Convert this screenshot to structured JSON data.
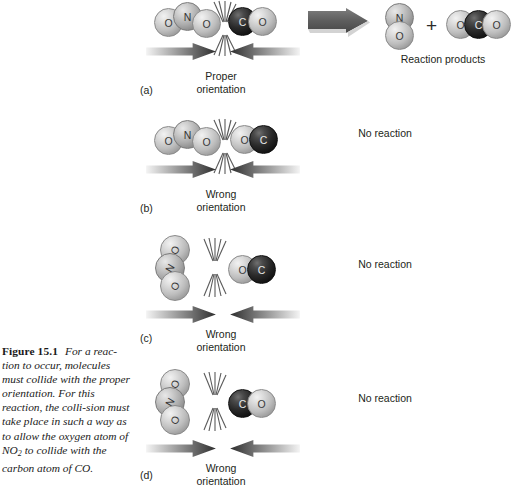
{
  "figure": {
    "number": "Figure 15.1",
    "caption_part1": "For a reac-",
    "caption_rest_a": "tion to occur, molecules must collide with the proper orientation. For this reaction, the colli-sion must take place in such a way as to allow the ",
    "caption_oxygen": "oxygen atom of NO",
    "caption_sub": "2",
    "caption_tail": " to collide with the carbon atom of CO."
  },
  "panels": [
    {
      "id": "a",
      "letter": "(a)",
      "orientation_line1": "Proper",
      "orientation_line2": "orientation",
      "reactant_left": {
        "name": "nitrogen-dioxide",
        "atoms": [
          "O",
          "N",
          "O"
        ],
        "layout": "horizontal"
      },
      "reactant_right": {
        "name": "carbon-monoxide",
        "atoms": [
          "C",
          "O"
        ],
        "layout": "horizontal"
      },
      "outcome": "reaction",
      "products_label": "Reaction products",
      "product_1": {
        "name": "nitric-oxide",
        "atoms": [
          "N",
          "O"
        ],
        "layout": "vertical"
      },
      "product_plus": "+",
      "product_2": {
        "name": "carbon-dioxide",
        "atoms": [
          "O",
          "C",
          "O"
        ],
        "layout": "horizontal"
      }
    },
    {
      "id": "b",
      "letter": "(b)",
      "orientation_line1": "Wrong",
      "orientation_line2": "orientation",
      "reactant_left": {
        "name": "nitrogen-dioxide",
        "atoms": [
          "O",
          "N",
          "O"
        ],
        "layout": "horizontal"
      },
      "reactant_right": {
        "name": "carbon-monoxide",
        "atoms": [
          "O",
          "C"
        ],
        "layout": "horizontal"
      },
      "outcome": "No reaction"
    },
    {
      "id": "c",
      "letter": "(c)",
      "orientation_line1": "Wrong",
      "orientation_line2": "orientation",
      "reactant_left": {
        "name": "nitrogen-dioxide",
        "atoms": [
          "O",
          "N",
          "O"
        ],
        "layout": "vertical"
      },
      "reactant_right": {
        "name": "carbon-monoxide",
        "atoms": [
          "O",
          "C"
        ],
        "layout": "horizontal"
      },
      "outcome": "No reaction"
    },
    {
      "id": "d",
      "letter": "(d)",
      "orientation_line1": "Wrong",
      "orientation_line2": "orientation",
      "reactant_left": {
        "name": "nitrogen-dioxide",
        "atoms": [
          "O",
          "N",
          "O"
        ],
        "layout": "vertical"
      },
      "reactant_right": {
        "name": "carbon-monoxide",
        "atoms": [
          "C",
          "O"
        ],
        "layout": "horizontal"
      },
      "outcome": "No reaction"
    }
  ],
  "atom_labels": {
    "oxygen": "O",
    "nitrogen": "N",
    "carbon": "C"
  },
  "colors": {
    "oxygen": "#bdbdbd",
    "nitrogen": "#ababab",
    "carbon": "#1a1a1a",
    "text": "#231f20",
    "arrow_dark": "#3a3a3a",
    "background": "#ffffff"
  }
}
